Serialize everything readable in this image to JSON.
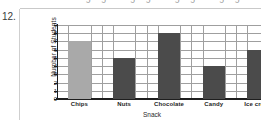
{
  "problem_number": "12.",
  "artifact": {
    "glyphs": "ɔɔ   ɔɔ   ɔɔ   ɔɔ"
  },
  "colors": {
    "bar_dark": "#4b4b4b",
    "bar_light": "#a9a9a9",
    "axis": "#1e1e1e",
    "grid": "#9f9f9f"
  },
  "chart_data": {
    "type": "bar",
    "title": "",
    "xlabel": "Snack",
    "ylabel": "Number of Students",
    "categories": [
      "Chips",
      "Nuts",
      "Chocolate",
      "Candy",
      "Ice cream"
    ],
    "values": [
      7,
      5,
      8,
      4,
      6
    ],
    "bar_colors": [
      "#a9a9a9",
      "#4b4b4b",
      "#4b4b4b",
      "#4b4b4b",
      "#4b4b4b"
    ],
    "ylim": [
      0,
      9
    ],
    "yticks": [
      0,
      1,
      2,
      3,
      4,
      5,
      6,
      7,
      8,
      9
    ],
    "ytick_labels": [
      "0",
      "1",
      "2",
      "3",
      "4",
      "5",
      "6",
      "7",
      "8",
      "9"
    ],
    "grid": true,
    "grid_axes": "both",
    "legend": false
  }
}
